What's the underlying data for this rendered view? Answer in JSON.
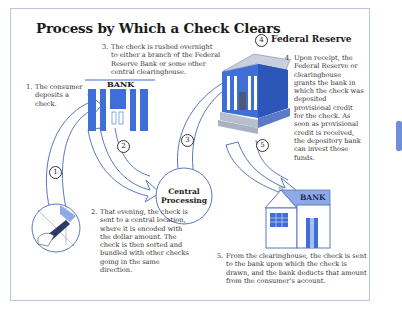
{
  "title": "Process by Which a Check Clears",
  "steps": [
    {
      "num": "1.",
      "text": "The consumer deposits a check."
    },
    {
      "num": "2.",
      "text": "That evening, the check is sent to a central location, where it is encoded with the dollar amount. The check is then sorted and bundled with other checks going in the same direction."
    },
    {
      "num": "3.",
      "text": "The check is rushed overnight to either a branch of the Federal Reserve Bank or some other central clearinghouse."
    },
    {
      "num": "4.",
      "text": "Upon receipt, the Federal Reserve or clearinghouse grants the bank in which the check was deposited provisional credit for the check. As soon as provisional credit is received, the depository bank can invest those funds."
    },
    {
      "num": "5.",
      "text": "From the clearinghouse, the check is sent to the bank upon which the check is drawn, and the bank deducts that amount from the consumer's account."
    }
  ],
  "labels": {
    "bank_top": "BANK",
    "bank_bottom": "BANK",
    "central": "Central Processing",
    "central_line1": "Central",
    "central_line2": "Processing",
    "federal_reserve": "Federal Reserve"
  },
  "arrow_markers": [
    "1",
    "2",
    "3",
    "4",
    "5"
  ],
  "colors": {
    "arrow_stroke": "#5a78c0",
    "building_blue": "#3f6fd6",
    "frame": "#b8c4dc",
    "accent_tab": "#6f8fd8"
  }
}
